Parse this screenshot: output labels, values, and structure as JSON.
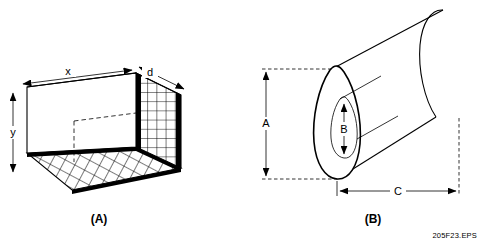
{
  "figure": {
    "source_label": "205F23.EPS",
    "ink_color": "#000000",
    "background_color": "#ffffff",
    "panels": [
      {
        "id": "A",
        "caption": "(A)",
        "shape": "rectangular-mesh-enclosure",
        "dimensions": [
          {
            "key": "x",
            "label": "x",
            "axis": "width",
            "arrow": "double"
          },
          {
            "key": "y",
            "label": "y",
            "axis": "height",
            "arrow": "double"
          },
          {
            "key": "d",
            "label": "d",
            "axis": "depth",
            "arrow": "double"
          }
        ]
      },
      {
        "id": "B",
        "caption": "(B)",
        "shape": "cylinder-with-axial-bore",
        "dimensions": [
          {
            "key": "A",
            "label": "A",
            "axis": "outer-diameter",
            "arrow": "double"
          },
          {
            "key": "B",
            "label": "B",
            "axis": "bore-diameter",
            "arrow": "double"
          },
          {
            "key": "C",
            "label": "C",
            "axis": "length",
            "arrow": "double"
          }
        ]
      }
    ]
  }
}
